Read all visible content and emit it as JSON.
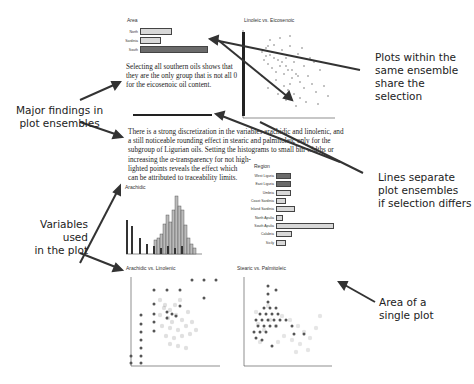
{
  "callouts": {
    "plots_share": "Plots within the same ensemble share the selection",
    "plots_share_lines": [
      "Plots within the",
      "same ensemble",
      "share the selection"
    ],
    "major_findings_lines": [
      "Major findings in",
      "plot ensembles"
    ],
    "lines_separate_lines": [
      "Lines separate",
      "plot ensembles",
      "if selection differs"
    ],
    "variables_used_lines": [
      "Variables used",
      "in the plot"
    ],
    "area_single_lines": [
      "Area of a",
      "single plot"
    ]
  },
  "ensemble1": {
    "area_plot": {
      "title": "Area",
      "bars": [
        {
          "label": "North",
          "width": 45,
          "selected": false
        },
        {
          "label": "Sardinia",
          "width": 30,
          "selected": false
        },
        {
          "label": "South",
          "width": 80,
          "selected": true
        }
      ]
    },
    "finding": "Selecting all southern oils shows that they are the only group that is not all 0 for the eicosenoic oil content.",
    "scatter_title": "Linoleic vs. Eicosenoic"
  },
  "ensemble2": {
    "finding_lines": [
      "There is a strong discretization in the variables arachidic and linolenic, and",
      "a still noticeable rounding effect in stearic and palmitoleic only for the",
      "subgroup of Ligurian oils. Setting the histograms to small bin widths or",
      "increasing the α-transparency for not high-",
      "lighted points reveals the effect which",
      "can be attributed to traceability limits."
    ],
    "histogram_title": "Arachidic",
    "histogram_axis": {
      "min": "0",
      "max": "100"
    },
    "region_plot": {
      "title": "Region",
      "bars": [
        {
          "label": "West Liguria",
          "width": 18,
          "selected": true
        },
        {
          "label": "East Liguria",
          "width": 18,
          "selected": true
        },
        {
          "label": "Umbria",
          "width": 18,
          "selected": false
        },
        {
          "label": "Coast Sardinia",
          "width": 12,
          "selected": false
        },
        {
          "label": "Inland Sardinia",
          "width": 23,
          "selected": false
        },
        {
          "label": "North Apulia",
          "width": 8,
          "selected": false
        },
        {
          "label": "South Apulia",
          "width": 78,
          "selected": false
        },
        {
          "label": "Calabria",
          "width": 20,
          "selected": false
        },
        {
          "label": "Sicily",
          "width": 13,
          "selected": false
        }
      ]
    },
    "scatter1_title": "Arachidic vs. Linolenic",
    "scatter2_title": "Stearic vs. Palmitoleic",
    "axis": {
      "min": "0",
      "max": "100"
    }
  }
}
